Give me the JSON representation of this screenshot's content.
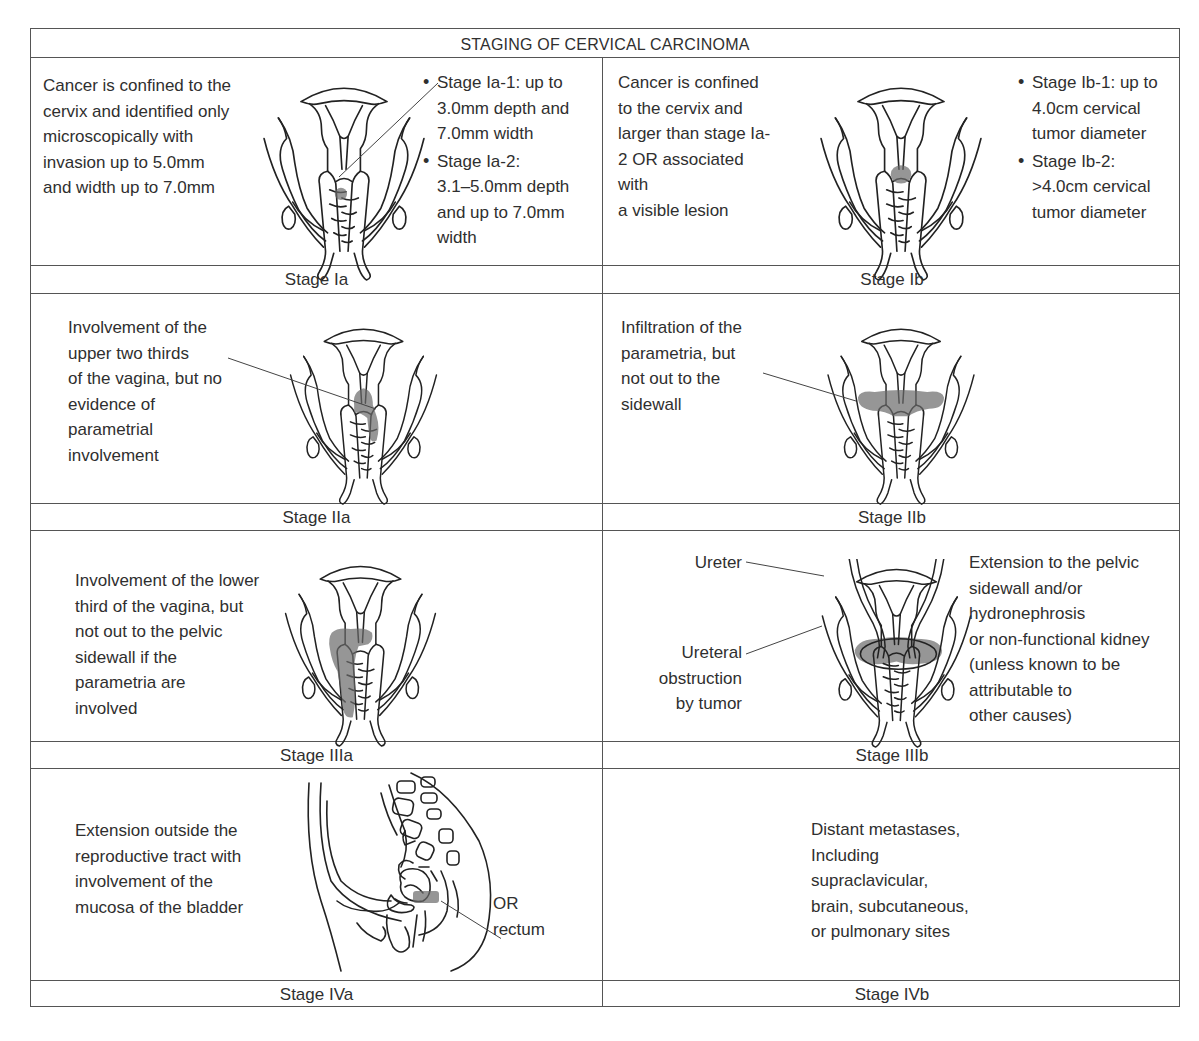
{
  "title": "STAGING OF CERVICAL CARCINOMA",
  "colors": {
    "text": "#2f2f2f",
    "grid": "#555555",
    "tumor_shading": "#6a6a6a"
  },
  "stages": {
    "Ia": {
      "label": "Stage Ia",
      "description": "Cancer is confined to the\ncervix and identified only\nmicroscopically with\ninvasion up to 5.0mm\nand width up to 7.0mm",
      "bullets": [
        "Stage Ia-1: up to\n3.0mm depth and\n7.0mm width",
        "Stage Ia-2:\n3.1–5.0mm depth\nand up to 7.0mm\n                width"
      ]
    },
    "Ib": {
      "label": "Stage Ib",
      "description": "Cancer is confined\nto the cervix and\nlarger than stage Ia-\n2 OR associated\nwith\na visible lesion",
      "bullets": [
        "Stage Ib-1: up to\n4.0cm cervical\ntumor diameter",
        "Stage Ib-2:\n>4.0cm cervical\ntumor diameter"
      ]
    },
    "IIa": {
      "label": "Stage IIa",
      "description": "Involvement of the\nupper two thirds\nof the vagina, but no\nevidence of\nparametrial\ninvolvement"
    },
    "IIb": {
      "label": "Stage IIb",
      "description": "Infiltration of the\nparametria, but\nnot out to the\nsidewall"
    },
    "IIIa": {
      "label": "Stage IIIa",
      "description": "Involvement of the lower\nthird of the vagina, but\nnot out to the pelvic\nsidewall if the\nparametria are\ninvolved"
    },
    "IIIb": {
      "label": "Stage IIIb",
      "ureter_label": "Ureter",
      "obstruction_label": "Ureteral\nobstruction\nby tumor",
      "description": "Extension to the pelvic\nsidewall and/or\nhydronephrosis\nor non-functional kidney\n(unless known to be\nattributable to\nother causes)"
    },
    "IVa": {
      "label": "Stage IVa",
      "description": "Extension outside the\nreproductive tract with\ninvolvement of the\nmucosa of the bladder",
      "callout": "OR\nrectum"
    },
    "IVb": {
      "label": "Stage IVb",
      "description": "Distant metastases,\nIncluding\nsupraclavicular,\nbrain, subcutaneous,\nor pulmonary sites"
    }
  },
  "icons": {
    "uterus_diagram": "uterus-frontal-diagram-icon",
    "pelvis_sagittal": "pelvis-sagittal-diagram-icon",
    "bullet": "bullet-icon"
  }
}
